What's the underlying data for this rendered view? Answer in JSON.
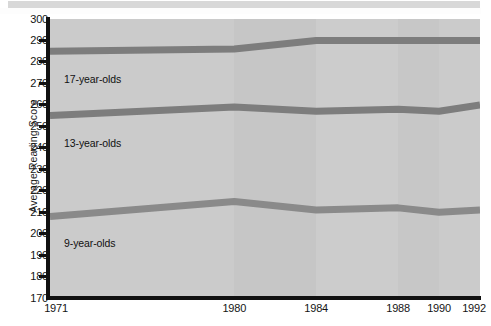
{
  "figure": {
    "background_color": "#ffffff",
    "plot_background_color": "#c9c9c9",
    "top_strip_color": "#d8d8d8"
  },
  "chart_data": {
    "type": "line",
    "title": "",
    "subtitle": "",
    "xlabel": "",
    "ylabel": "Average Reading Score",
    "categories": [
      "1971",
      "1980",
      "1984",
      "1988",
      "1990",
      "1992"
    ],
    "x": [
      1971,
      1980,
      1984,
      1988,
      1990,
      1992
    ],
    "ylim": [
      170,
      300
    ],
    "xlim": [
      1971,
      1992
    ],
    "y_ticks": [
      170,
      180,
      190,
      200,
      210,
      220,
      230,
      240,
      250,
      260,
      270,
      280,
      290,
      300
    ],
    "y_tick_labels": [
      "170",
      "180",
      "190",
      "200",
      "210",
      "220",
      "230",
      "240",
      "250",
      "260",
      "270",
      "280",
      "290",
      "300"
    ],
    "x_ticks": [
      1971,
      1980,
      1984,
      1988,
      1990,
      1992
    ],
    "x_tick_labels": [
      "1971",
      "1980",
      "1984",
      "1988",
      "1990",
      "1992"
    ],
    "grid": false,
    "legend_position": "inline-annotations",
    "line_color": "#7f7f7f",
    "line_width_px": 7,
    "series": [
      {
        "name": "17-year-olds",
        "label": "17-year-olds",
        "color": "#7d7d7d",
        "values": [
          285,
          286,
          290,
          290,
          290,
          290
        ]
      },
      {
        "name": "13-year-olds",
        "label": "13-year-olds",
        "color": "#7d7d7d",
        "values": [
          255,
          259,
          257,
          258,
          257,
          260
        ]
      },
      {
        "name": "9-year-olds",
        "label": "9-year-olds",
        "color": "#8a8a8a",
        "values": [
          208,
          215,
          211,
          212,
          210,
          211
        ]
      }
    ],
    "annotations": [
      {
        "text": "17-year-olds",
        "series": "17-year-olds"
      },
      {
        "text": "13-year-olds",
        "series": "13-year-olds"
      },
      {
        "text": "9-year-olds",
        "series": "9-year-olds"
      }
    ]
  }
}
